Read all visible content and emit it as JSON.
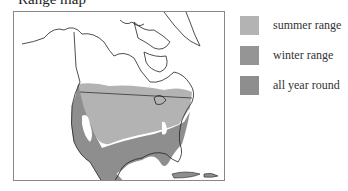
{
  "title": "Range map",
  "map": {
    "region": "North America",
    "colors": {
      "summer": "#b3b3b3",
      "winter": "#8e8e8e",
      "year_round": "#8e8e8e",
      "land": "#ffffff",
      "outline": "#222222"
    }
  },
  "legend": {
    "items": [
      {
        "label": "summer range",
        "color": "#b3b3b3"
      },
      {
        "label": "winter range",
        "color": "#959595"
      },
      {
        "label": "all year round",
        "color": "#8e8e8e"
      }
    ]
  }
}
